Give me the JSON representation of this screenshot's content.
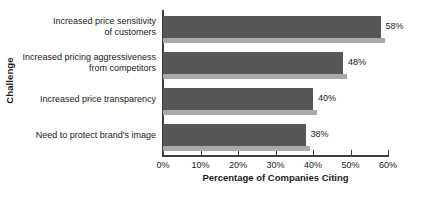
{
  "chart_data": {
    "type": "bar",
    "orientation": "horizontal",
    "title": "",
    "xlabel": "Percentage of Companies Citing",
    "ylabel": "Challenge",
    "categories": [
      "Increased price sensitivity\nof customers",
      "Increased pricing aggressiveness\nfrom competitors",
      "Increased price transparency",
      "Need to protect brand's image"
    ],
    "values": [
      58,
      48,
      40,
      38
    ],
    "value_labels": [
      "58%",
      "48%",
      "40%",
      "38%"
    ],
    "xlim": [
      0,
      60
    ],
    "xticks": [
      0,
      10,
      20,
      30,
      40,
      50,
      60
    ],
    "xtick_labels": [
      "0%",
      "10%",
      "20%",
      "30%",
      "40%",
      "50%",
      "60%"
    ],
    "grid": false,
    "legend": "none",
    "series": [
      {
        "name": "Percentage of Companies Citing",
        "values": [
          58,
          48,
          40,
          38
        ]
      }
    ],
    "colors": {
      "bar_fill": "#575757",
      "bar_shadow": "#a9a9a9",
      "axis": "#3c3c3c",
      "text": "#1a1a1a",
      "background": "#ffffff"
    }
  }
}
